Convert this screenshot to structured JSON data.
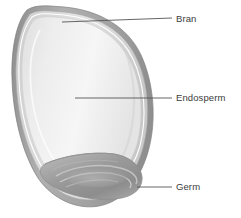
{
  "diagram": {
    "background_color": "#ffffff",
    "label_color": "#3c3c3c",
    "leader_line_color": "#555555"
  },
  "labels": {
    "bran": "Bran",
    "endosperm": "Endosperm",
    "germ": "Germ"
  },
  "parts": [
    {
      "key": "bran",
      "name": "Bran",
      "color": "#9a9a9a",
      "description": "outer multi-layered husk of the kernel"
    },
    {
      "key": "endosperm",
      "name": "Endosperm",
      "color": "#e8e8e8",
      "description": "large pale starchy interior of the kernel"
    },
    {
      "key": "germ",
      "name": "Germ",
      "color": "#9d9d9d",
      "description": "darker embryo lobe at the base of the kernel"
    }
  ],
  "leaders": [
    {
      "key": "bran",
      "from_x": 62,
      "from_y": 22,
      "to_x": 172,
      "to_y": 18
    },
    {
      "key": "endosperm",
      "from_x": 75,
      "from_y": 98,
      "to_x": 172,
      "to_y": 98
    },
    {
      "key": "germ",
      "from_x": 137,
      "from_y": 187,
      "to_x": 172,
      "to_y": 187
    }
  ],
  "colors": {
    "bran_outer": "#8e8e8e",
    "bran_mid": "#b4b4b4",
    "bran_inner": "#d6d6d6",
    "endosperm_light": "#f4f4f4",
    "endosperm_shade": "#dcdcdc",
    "germ_dark": "#8d8d8d",
    "germ_light": "#bdbdbd",
    "outline": "#7d7d7d"
  }
}
